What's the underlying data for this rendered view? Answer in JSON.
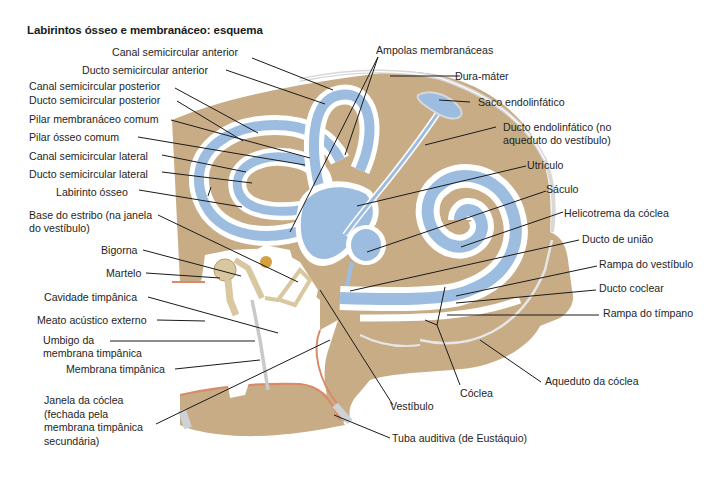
{
  "title": "Labirintos ósseo e membranáceo: esquema",
  "colors": {
    "bone": "#c8ac86",
    "bone_dark": "#b89a72",
    "membrane": "#9dbde0",
    "membrane_dark": "#7aa0cc",
    "perilymph": "#ffffff",
    "dura": "#d7d7d7",
    "mucosa": "#d98a68",
    "ossicle": "#d9c7a0",
    "leader": "#1a1a1a"
  },
  "labels_left": [
    {
      "id": "canal-semicircular-anterior",
      "text": "Canal semicircular anterior"
    },
    {
      "id": "ducto-semicircular-anterior",
      "text": "Ducto semicircular anterior"
    },
    {
      "id": "canal-semicircular-posterior",
      "text": "Canal semicircular posterior"
    },
    {
      "id": "ducto-semicircular-posterior",
      "text": "Ducto semicircular posterior"
    },
    {
      "id": "pilar-membranaceo-comum",
      "text": "Pilar membranáceo comum"
    },
    {
      "id": "pilar-osseo-comum",
      "text": "Pilar ósseo comum"
    },
    {
      "id": "canal-semicircular-lateral",
      "text": "Canal semicircular lateral"
    },
    {
      "id": "ducto-semicircular-lateral",
      "text": "Ducto semicircular lateral"
    },
    {
      "id": "labirinto-osseo",
      "text": "Labirinto ósseo"
    },
    {
      "id": "base-do-estribo",
      "text": "Base do estribo (na janela",
      "text2": "do vestíbulo)"
    },
    {
      "id": "bigorna",
      "text": "Bigorna"
    },
    {
      "id": "martelo",
      "text": "Martelo"
    },
    {
      "id": "cavidade-timpanica",
      "text": "Cavidade timpânica"
    },
    {
      "id": "meato-acustico-externo",
      "text": "Meato acústico externo"
    },
    {
      "id": "umbigo-membrana",
      "text": "Umbigo da",
      "text2": "membrana timpânica"
    },
    {
      "id": "membrana-timpanica",
      "text": "Membrana timpânica"
    },
    {
      "id": "janela-da-coclea",
      "text": "Janela da cóclea",
      "text2": "(fechada pela",
      "text3": "membrana timpânica",
      "text4": "secundária)"
    }
  ],
  "labels_right": [
    {
      "id": "ampolas-membranaceas",
      "text": "Ampolas membranáceas"
    },
    {
      "id": "dura-mater",
      "text": "Dura-máter"
    },
    {
      "id": "saco-endolinfatico",
      "text": "Saco endolinfático"
    },
    {
      "id": "ducto-endolinfatico",
      "text": "Ducto endolinfático (no",
      "text2": "aqueduto do vestíbulo)"
    },
    {
      "id": "utriculo",
      "text": "Utrículo"
    },
    {
      "id": "saculo",
      "text": "Sáculo"
    },
    {
      "id": "helicotrema",
      "text": "Helicotrema da cóclea"
    },
    {
      "id": "ducto-de-uniao",
      "text": "Ducto de união"
    },
    {
      "id": "rampa-do-vestibulo",
      "text": "Rampa do vestíbulo"
    },
    {
      "id": "ducto-coclear",
      "text": "Ducto coclear"
    },
    {
      "id": "rampa-do-timpano",
      "text": "Rampa do tímpano"
    }
  ],
  "labels_bottom": [
    {
      "id": "aqueduto-da-coclea",
      "text": "Aqueduto da cóclea"
    },
    {
      "id": "coclea",
      "text": "Cóclea"
    },
    {
      "id": "vestibulo",
      "text": "Vestíbulo"
    },
    {
      "id": "tuba-auditiva",
      "text": "Tuba auditiva (de Eustáquio)"
    }
  ]
}
